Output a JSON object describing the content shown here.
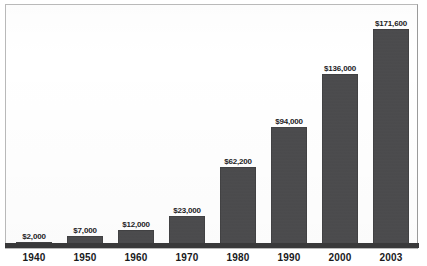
{
  "chart_data": {
    "type": "bar",
    "title": "",
    "subtitle": "",
    "xlabel": "",
    "ylabel": "",
    "categories": [
      "1940",
      "1950",
      "1960",
      "1970",
      "1980",
      "1990",
      "2000",
      "2003"
    ],
    "values": [
      2000,
      7000,
      12000,
      23000,
      62200,
      94000,
      136000,
      171600
    ],
    "value_labels": [
      "$2,000",
      "$7,000",
      "$12,000",
      "$23,000",
      "$62,200",
      "$94,000",
      "$136,000",
      "$171,600"
    ],
    "ylim": [
      0,
      171600
    ],
    "grid": false,
    "legend": null,
    "legend_position": "none",
    "axis_visible": {
      "x": true,
      "y": false
    },
    "series": [
      {
        "name": "value",
        "values": [
          2000,
          7000,
          12000,
          23000,
          62200,
          94000,
          136000,
          171600
        ]
      }
    ],
    "colors": {
      "bar_fill": "#4a4a4c",
      "axis": "#39393a",
      "frame": "#b9b9b9",
      "label_text": "#1d1d1f",
      "category_text": "#19191b",
      "background": "#ffffff"
    }
  }
}
